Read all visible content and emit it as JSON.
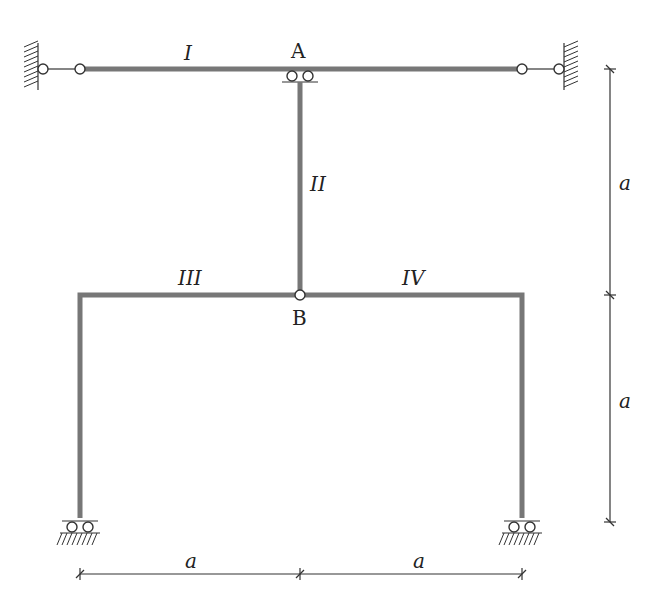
{
  "diagram": {
    "type": "structural-frame",
    "nodes": {
      "A": "A",
      "B": "B"
    },
    "members": {
      "I": "I",
      "II": "II",
      "III": "III",
      "IV": "IV"
    },
    "dimensions": {
      "right_upper": "a",
      "right_lower": "a",
      "bottom_left": "a",
      "bottom_right": "a"
    },
    "colors": {
      "beam": "#777777",
      "line": "#333333",
      "background": "#ffffff"
    }
  }
}
